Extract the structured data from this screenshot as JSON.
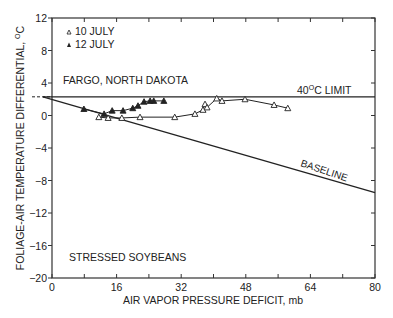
{
  "chart_data": {
    "type": "line",
    "title": "",
    "xlabel": "AIR VAPOR PRESSURE DEFICIT, mb",
    "ylabel": "FOLIAGE-AIR TEMPERATURE DIFFERENTIAL, °C",
    "xlim": [
      0,
      80
    ],
    "ylim": [
      -20,
      12
    ],
    "xticks": [
      0,
      16,
      32,
      48,
      64,
      80
    ],
    "yticks": [
      12,
      8,
      4,
      0,
      -4,
      -8,
      -12,
      -16,
      -20
    ],
    "grid": false,
    "legend_position": "upper-left",
    "annotations": [
      "FARGO, NORTH DAKOTA",
      "40°C LIMIT",
      "BASELINE",
      "STRESSED SOYBEANS"
    ],
    "series": [
      {
        "name": "10 JULY",
        "marker": "open-triangle",
        "x": [
          11.6,
          13.9,
          17.3,
          21.8,
          30.4,
          35.4,
          37.4,
          37.9,
          38.4,
          40.8,
          42.1,
          47.8,
          55.0,
          58.4
        ],
        "y": [
          -0.2,
          -0.3,
          -0.3,
          -0.2,
          -0.2,
          0.2,
          0.7,
          1.4,
          1.0,
          2.1,
          1.8,
          2.0,
          1.3,
          0.9
        ]
      },
      {
        "name": "12 JULY",
        "marker": "filled-triangle",
        "x": [
          7.9,
          12.9,
          14.9,
          17.6,
          20.0,
          21.3,
          22.8,
          24.3,
          25.2,
          27.7
        ],
        "y": [
          0.8,
          0.2,
          0.6,
          0.6,
          0.9,
          1.2,
          1.7,
          1.8,
          1.8,
          1.8
        ]
      }
    ],
    "reference_lines": [
      {
        "name": "40°C LIMIT",
        "x": [
          -1,
          80
        ],
        "y": [
          2.3,
          2.3
        ]
      },
      {
        "name": "BASELINE",
        "x": [
          -1,
          80
        ],
        "y": [
          2.3,
          -9.5
        ]
      }
    ]
  },
  "legend": {
    "item1": "10 JULY",
    "item2": "12 JULY"
  },
  "annotations": {
    "location": "FARGO, NORTH DAKOTA",
    "limit": "40",
    "limit_unit": "O",
    "limit_suffix": "C LIMIT",
    "baseline": "BASELINE",
    "crop": "STRESSED SOYBEANS"
  },
  "axes": {
    "xlabel": "AIR VAPOR PRESSURE DEFICIT, mb",
    "ylabel": "FOLIAGE-AIR TEMPERATURE DIFFERENTIAL, ",
    "ylabel_unit_sup": "O",
    "ylabel_unit": "C",
    "xticks": [
      "0",
      "16",
      "32",
      "48",
      "64",
      "80"
    ],
    "yticks": [
      "12",
      "8",
      "4",
      "0",
      "-4",
      "-8",
      "-12",
      "-16",
      "-20"
    ]
  }
}
